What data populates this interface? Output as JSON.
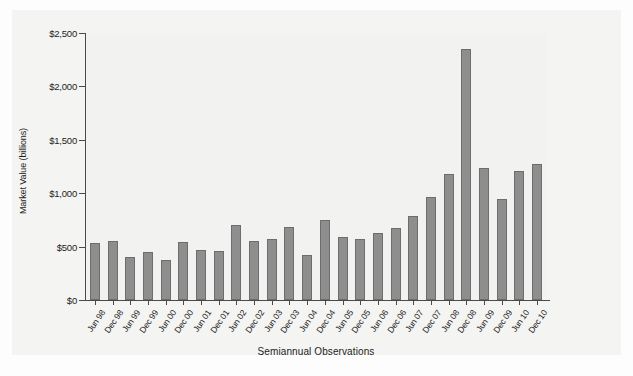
{
  "chart_data": {
    "type": "bar",
    "title": "",
    "xlabel": "Semiannual Observations",
    "ylabel": "Market Value (billions)",
    "ylim": [
      0,
      2500
    ],
    "ytick_values": [
      0,
      500,
      1000,
      1500,
      2000,
      2500
    ],
    "ytick_labels": [
      "$0",
      "$500",
      "$1,000",
      "$1,500",
      "$2,000",
      "$2,500"
    ],
    "grid": false,
    "legend": null,
    "bar_color": "#8e8e8e",
    "bar_edge_color": "#6d6d6d",
    "categories": [
      "Jun 98",
      "Dec 98",
      "Jun 99",
      "Dec 99",
      "Jun 00",
      "Dec 00",
      "Jun 01",
      "Dec 01",
      "Jun 02",
      "Dec 02",
      "Jun 03",
      "Dec 03",
      "Jun 04",
      "Dec 04",
      "Jun 05",
      "Dec 05",
      "Jun 06",
      "Dec 06",
      "Jun 07",
      "Dec 07",
      "Jun 08",
      "Dec 08",
      "Jun 09",
      "Dec 09",
      "Jun 10",
      "Dec 10"
    ],
    "values": [
      535,
      555,
      400,
      450,
      375,
      545,
      470,
      460,
      700,
      555,
      575,
      685,
      420,
      750,
      590,
      570,
      625,
      670,
      790,
      965,
      1180,
      2350,
      1240,
      950,
      1205,
      1275
    ]
  }
}
